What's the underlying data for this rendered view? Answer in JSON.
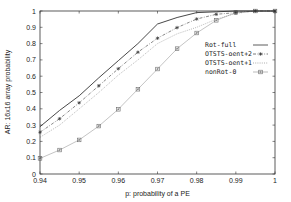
{
  "chart_data": {
    "type": "line",
    "title": "",
    "xlabel": "p: probability of a PE",
    "ylabel": "AR: 16x16 array probability",
    "xlim": [
      0.94,
      1.0
    ],
    "ylim": [
      0,
      1
    ],
    "xticks": [
      "0.94",
      "0.95",
      "0.96",
      "0.97",
      "0.98",
      "0.99",
      "1"
    ],
    "yticks": [
      "0",
      "0.1",
      "0.2",
      "0.3",
      "0.4",
      "0.5",
      "0.6",
      "0.7",
      "0.8",
      "0.9",
      "1"
    ],
    "grid": false,
    "legend_position": "center-right",
    "x": [
      0.94,
      0.945,
      0.95,
      0.955,
      0.96,
      0.965,
      0.97,
      0.975,
      0.98,
      0.985,
      0.99,
      0.995,
      1.0
    ],
    "series": [
      {
        "name": "Rot-full",
        "style": "solid",
        "color": "#333333",
        "marker": "none",
        "values": [
          0.29,
          0.39,
          0.48,
          0.59,
          0.695,
          0.8,
          0.92,
          0.96,
          0.99,
          0.995,
          1.0,
          1.0,
          1.0
        ]
      },
      {
        "name": "OTSTS-oent+2",
        "style": "dashdot",
        "color": "#555555",
        "marker": "star",
        "values": [
          0.256,
          0.339,
          0.437,
          0.541,
          0.646,
          0.747,
          0.833,
          0.898,
          0.951,
          0.98,
          0.99,
          1.0,
          1.0
        ]
      },
      {
        "name": "OTSTS-oent+1",
        "style": "dotted",
        "color": "#999999",
        "marker": "none",
        "values": [
          0.225,
          0.3,
          0.4,
          0.5,
          0.607,
          0.7,
          0.8,
          0.86,
          0.9,
          0.95,
          0.985,
          1.0,
          1.0
        ]
      },
      {
        "name": "nonRot-0",
        "style": "solid",
        "color": "#aaaaaa",
        "marker": "square",
        "values": [
          0.096,
          0.147,
          0.209,
          0.294,
          0.397,
          0.52,
          0.644,
          0.769,
          0.865,
          0.943,
          0.99,
          1.0,
          1.0
        ]
      }
    ]
  }
}
